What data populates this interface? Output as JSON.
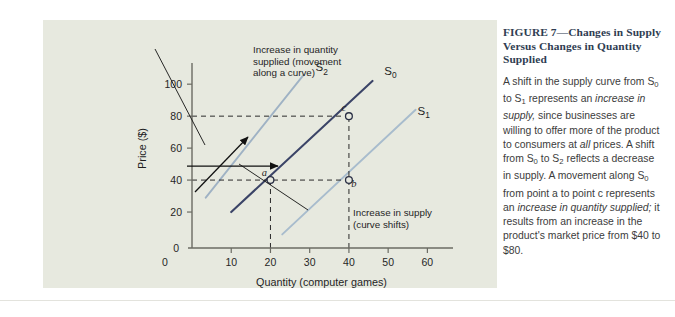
{
  "figure": {
    "title_prefix": "FIGURE 7",
    "title_dash": "—",
    "title_rest": "Changes in Supply Versus Changes in Quantity Supplied",
    "title_color": "#2f3d52",
    "panel_background": "#e7e9df"
  },
  "caption": {
    "seg1": "A shift in the supply curve from S",
    "sub1": "0",
    "seg2": " to S",
    "sub2": "1",
    "seg3": " represents an ",
    "em1": "increase in supply,",
    "seg4": " since businesses are willing to offer more of the product to consumers at ",
    "em2": "all",
    "seg5": " prices. A shift from S",
    "sub3": "0",
    "seg6": " to S",
    "sub4": "2",
    "seg7": " reflects a decrease in supply. A movement along S",
    "sub5": "0",
    "seg8": " from point a to point c represents an ",
    "em3": "increase in quantity supplied;",
    "seg9": " it results from an increase in the product's market price from $40 to $80."
  },
  "chart_data": {
    "type": "line",
    "title": "",
    "xlabel": "Quantity (computer games)",
    "ylabel": "Price ($)",
    "xlim": [
      0,
      65
    ],
    "ylim": [
      0,
      112
    ],
    "xticks": [
      0,
      10,
      20,
      30,
      40,
      50,
      60
    ],
    "yticks": [
      0,
      20,
      40,
      60,
      80,
      100
    ],
    "grid": false,
    "series": [
      {
        "name": "S0",
        "label": "S",
        "sub": "0",
        "color": "#3b4467",
        "width": 2.1,
        "points": [
          [
            10,
            20
          ],
          [
            46,
            102
          ]
        ],
        "label_pos": [
          49,
          106
        ]
      },
      {
        "name": "S2",
        "label": "S",
        "sub": "2",
        "color": "#9fb2c4",
        "width": 1.9,
        "points": [
          [
            3.5,
            29
          ],
          [
            28.5,
            106
          ]
        ],
        "label_pos": [
          31.5,
          108
        ]
      },
      {
        "name": "S1",
        "label": "S",
        "sub": "1",
        "color": "#a8bccd",
        "width": 1.9,
        "points": [
          [
            23,
            6
          ],
          [
            57,
            84
          ]
        ],
        "label_pos": [
          57.5,
          81
        ]
      }
    ],
    "points": [
      {
        "label": "a",
        "x": 20,
        "y": 40,
        "label_dx": -6,
        "label_dy": -4,
        "curve": "S0"
      },
      {
        "label": "c",
        "x": 40,
        "y": 80,
        "label_dx": -5,
        "label_dy": -5,
        "curve": "S0"
      },
      {
        "label": "b",
        "x": 40,
        "y": 40,
        "label_dx": 5,
        "label_dy": 7,
        "curve": "S1"
      }
    ],
    "guide_lines": [
      {
        "type": "horizontal",
        "value": 80,
        "from": 0,
        "to": 40
      },
      {
        "type": "horizontal",
        "value": 40,
        "from": 0,
        "to": 40
      },
      {
        "type": "vertical",
        "value": 20,
        "from": 0,
        "to": 40
      },
      {
        "type": "vertical",
        "value": 40,
        "from": 0,
        "to": 80
      }
    ],
    "annotations": [
      {
        "name": "increase-in-quantity-supplied",
        "lines": [
          "Increase in quantity",
          "supplied (movement",
          "along a curve)"
        ],
        "text_x": 210,
        "text_y": 33
      },
      {
        "name": "increase-in-supply",
        "lines": [
          "Increase in supply",
          "(curve shifts)"
        ],
        "text_x": 310,
        "text_y": 196
      }
    ]
  }
}
